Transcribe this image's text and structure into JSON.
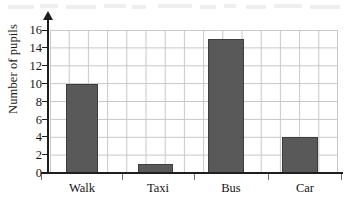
{
  "chart_data": {
    "type": "bar",
    "title": "",
    "subtitle": "",
    "xlabel": "",
    "ylabel": "Number of pupils",
    "categories": [
      "Walk",
      "Taxi",
      "Bus",
      "Car"
    ],
    "values": [
      10,
      1,
      15,
      4
    ],
    "series": [
      {
        "name": "Number of pupils",
        "values": [
          10,
          1,
          15,
          4
        ]
      }
    ],
    "ylim": [
      0,
      16
    ],
    "y_tick_step": 2,
    "y_ticks": [
      0,
      2,
      4,
      6,
      8,
      10,
      12,
      14,
      16
    ],
    "y_tick_labels": [
      "0",
      "2",
      "4",
      "6",
      "8",
      "10",
      "12",
      "14",
      "16"
    ],
    "grid": true,
    "grid_orientation": "both",
    "legend": false,
    "legend_position": "none",
    "bar_color": "#595959",
    "bar_edge_color": "#3d3d3d",
    "grid_color": "#c8c8c8",
    "axis_color": "#1e1e1e",
    "text_color": "#141414",
    "background_color": "#ffffff",
    "y_axis_has_arrow": true,
    "annotations": []
  },
  "icons": {
    "y_axis_arrow": "arrow-up-icon"
  }
}
